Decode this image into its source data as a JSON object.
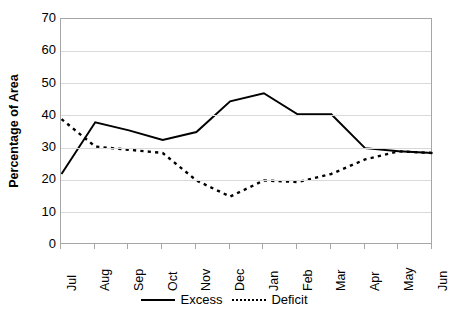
{
  "chart_data": {
    "type": "line",
    "title": "",
    "xlabel": "",
    "ylabel": "Percentage of Area",
    "categories": [
      "Jul",
      "Aug",
      "Sep",
      "Oct",
      "Nov",
      "Dec",
      "Jan",
      "Feb",
      "Mar",
      "Apr",
      "May",
      "Jun"
    ],
    "yticks": [
      0,
      10,
      20,
      30,
      40,
      50,
      60,
      70
    ],
    "ylim": [
      0,
      70
    ],
    "grid": true,
    "legend_position": "bottom",
    "series": [
      {
        "name": "Excess",
        "style": "solid",
        "color": "#000000",
        "values": [
          22,
          38,
          35.5,
          32.5,
          35,
          44.5,
          47,
          40.5,
          40.5,
          30,
          29,
          28.5
        ]
      },
      {
        "name": "Deficit",
        "style": "dotted",
        "color": "#000000",
        "values": [
          39,
          30.5,
          29.5,
          28.5,
          20,
          15,
          20,
          19.5,
          22,
          26.5,
          29,
          28.5
        ]
      }
    ]
  },
  "axis": {
    "y_title": "Percentage of Area",
    "y_tick_labels": [
      "70",
      "60",
      "50",
      "40",
      "30",
      "20",
      "10",
      "0"
    ],
    "x_tick_labels": [
      "Jul",
      "Aug",
      "Sep",
      "Oct",
      "Nov",
      "Dec",
      "Jan",
      "Feb",
      "Mar",
      "Apr",
      "May",
      "Jun"
    ]
  },
  "legend": {
    "items": [
      {
        "label": "Excess",
        "style": "solid"
      },
      {
        "label": "Deficit",
        "style": "dotted"
      }
    ]
  }
}
